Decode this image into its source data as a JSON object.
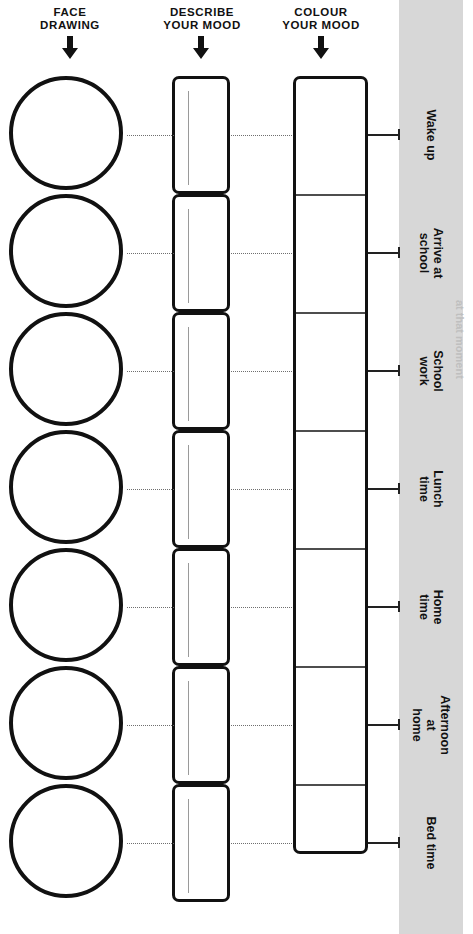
{
  "columns": [
    {
      "key": "face",
      "label": "FACE\nDRAWING",
      "arrow_icon": "down-arrow-icon"
    },
    {
      "key": "desc",
      "label": "DESCRIBE\nYOUR MOOD",
      "arrow_icon": "down-arrow-icon"
    },
    {
      "key": "colour",
      "label": "COLOUR\nYOUR MOOD",
      "arrow_icon": "down-arrow-icon"
    }
  ],
  "rows": [
    {
      "label": "Wake up",
      "face_value": "",
      "desc_value": "",
      "colour_value": ""
    },
    {
      "label": "Arrive at\nschool",
      "face_value": "",
      "desc_value": "",
      "colour_value": ""
    },
    {
      "label": "School work",
      "face_value": "",
      "desc_value": "",
      "colour_value": ""
    },
    {
      "label": "Lunch\ntime",
      "face_value": "",
      "desc_value": "",
      "colour_value": ""
    },
    {
      "label": "Home\ntime",
      "face_value": "",
      "desc_value": "",
      "colour_value": ""
    },
    {
      "label": "Afternoon at\nhome",
      "face_value": "",
      "desc_value": "",
      "colour_value": ""
    },
    {
      "label": "Bed time",
      "face_value": "",
      "desc_value": "",
      "colour_value": ""
    }
  ],
  "edge_note": "at that moment",
  "colors": {
    "ink": "#111111",
    "band": "#d7d7d7",
    "rule": "#9a9a9a",
    "divider": "#4d4d4d",
    "paper": "#ffffff"
  }
}
